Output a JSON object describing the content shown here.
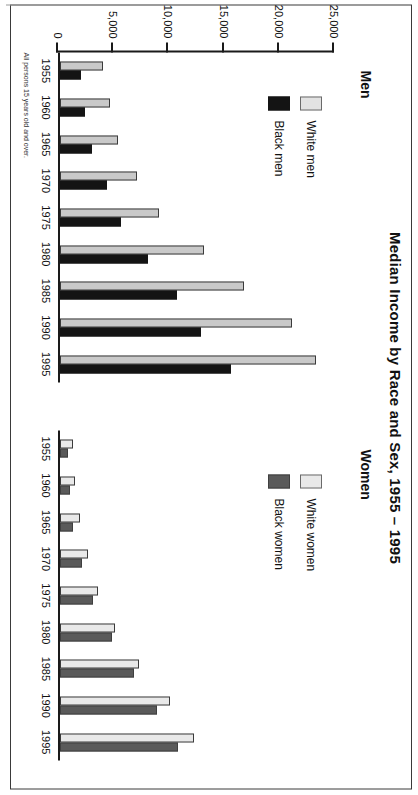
{
  "title": "Median Income by Race and Sex, 1955 – 1995",
  "footnote": "All persons 15 years old and over.",
  "panels": {
    "men": {
      "label": "Men",
      "legend": [
        {
          "key": "white_men",
          "label": "White men",
          "color": "#e2e2e2"
        },
        {
          "key": "black_men",
          "label": "Black men",
          "color": "#141414"
        }
      ]
    },
    "women": {
      "label": "Women",
      "legend": [
        {
          "key": "white_women",
          "label": "White women",
          "color": "#e9e9e9"
        },
        {
          "key": "black_women",
          "label": "Black women",
          "color": "#5a5a5a"
        }
      ]
    }
  },
  "axis": {
    "y_ticks": [
      "25,000",
      "20,000",
      "15,000",
      "10,000",
      "5,000",
      "0"
    ],
    "x_ticks": [
      "1955",
      "1960",
      "1965",
      "1970",
      "1975",
      "1980",
      "1985",
      "1990",
      "1995"
    ]
  },
  "chart_data": [
    {
      "type": "bar",
      "title": "Men",
      "chart_title": "Median Income by Race and Sex, 1955 – 1995",
      "categories": [
        "1955",
        "1960",
        "1965",
        "1970",
        "1975",
        "1980",
        "1985",
        "1990",
        "1995"
      ],
      "series": [
        {
          "name": "White men",
          "color": "#c9c9c9",
          "values": [
            3900,
            4500,
            5300,
            7000,
            9000,
            13000,
            16700,
            21000,
            23200
          ]
        },
        {
          "name": "Black men",
          "color": "#141414",
          "values": [
            1900,
            2300,
            2900,
            4300,
            5500,
            8000,
            10600,
            12800,
            15500
          ]
        }
      ],
      "xlabel": "",
      "ylabel": "",
      "ylim": [
        0,
        25000
      ],
      "grid": false,
      "legend_position": "top-left",
      "annotations": [
        "All persons 15 years old and over."
      ]
    },
    {
      "type": "bar",
      "title": "Women",
      "chart_title": "Median Income by Race and Sex, 1955 – 1995",
      "categories": [
        "1955",
        "1960",
        "1965",
        "1970",
        "1975",
        "1980",
        "1985",
        "1990",
        "1995"
      ],
      "series": [
        {
          "name": "White women",
          "color": "#e9e9e9",
          "values": [
            1200,
            1400,
            1800,
            2500,
            3400,
            5000,
            7200,
            10000,
            12100
          ]
        },
        {
          "name": "Black women",
          "color": "#5a5a5a",
          "values": [
            700,
            900,
            1200,
            2000,
            3000,
            4700,
            6700,
            8800,
            10700
          ]
        }
      ],
      "xlabel": "",
      "ylabel": "",
      "ylim": [
        0,
        25000
      ],
      "grid": false,
      "legend_position": "top-left"
    }
  ]
}
